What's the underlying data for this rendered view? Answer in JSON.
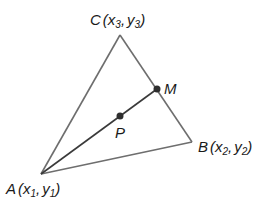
{
  "diagram": {
    "type": "triangle-median",
    "colors": {
      "edge": "#6e6e6e",
      "median": "#3a3a3a",
      "point": "#2e2e2e",
      "text": "#1a1a1a"
    },
    "vertices": {
      "A": {
        "name": "A",
        "open": "(",
        "x": "x",
        "xsub": "1",
        "sep": ",",
        "y": "y",
        "ysub": "1",
        "close": ")"
      },
      "B": {
        "name": "B",
        "open": "(",
        "x": "x",
        "xsub": "2",
        "sep": ",",
        "y": "y",
        "ysub": "2",
        "close": ")"
      },
      "C": {
        "name": "C",
        "open": "(",
        "x": "x",
        "xsub": "3",
        "sep": ",",
        "y": "y",
        "ysub": "3",
        "close": ")"
      }
    },
    "points": {
      "M": {
        "name": "M",
        "description": "midpoint of BC"
      },
      "P": {
        "name": "P",
        "description": "point on median AM"
      }
    }
  }
}
